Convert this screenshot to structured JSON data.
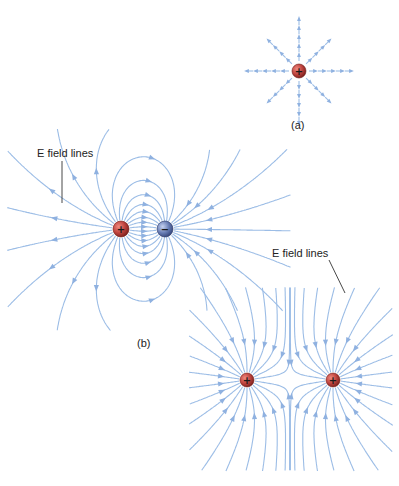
{
  "colors": {
    "field_line": "#9cbde6",
    "arrow": "#8fb1e0",
    "positive_charge": "#c0443f",
    "negative_charge": "#6a7fb6",
    "text": "#222222"
  },
  "panel_a": {
    "caption": "(a)",
    "charge": {
      "sign": "+",
      "type": "positive",
      "x": 299,
      "y": 71
    },
    "radial_lines": 8,
    "arrow_direction": "outward"
  },
  "panel_b": {
    "caption": "(b)",
    "dipole": {
      "label": "E field lines",
      "charges": [
        {
          "sign": "+",
          "type": "positive",
          "x": 121,
          "y": 229
        },
        {
          "sign": "−",
          "type": "negative",
          "x": 165,
          "y": 229
        }
      ]
    },
    "like_charges": {
      "label": "E field lines",
      "charges": [
        {
          "sign": "+",
          "type": "positive",
          "x": 247,
          "y": 380
        },
        {
          "sign": "+",
          "type": "positive",
          "x": 333,
          "y": 380
        }
      ]
    }
  }
}
